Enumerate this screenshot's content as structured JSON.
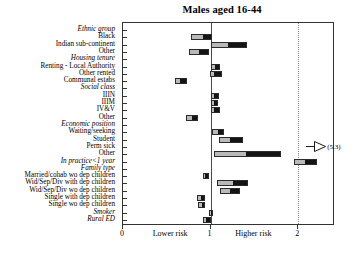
{
  "chart_data": {
    "type": "bar",
    "title": "Males aged 16-44",
    "xlabel": "",
    "ylabel": "",
    "xlim": [
      0,
      2.42
    ],
    "grid": false,
    "legend_position": "none",
    "reference_lines": [
      {
        "value": 1,
        "style": "solid"
      },
      {
        "value": 2,
        "style": "dotted"
      }
    ],
    "xticks": [
      0,
      1,
      2
    ],
    "xtick_labels": [
      "0",
      "1",
      "2"
    ],
    "zone_labels": [
      {
        "text": "Lower risk",
        "x": 0.55
      },
      {
        "text": "Higher risk",
        "x": 1.5
      }
    ],
    "annotations": [
      {
        "text": "(5.3)",
        "row": "Perm sick",
        "type": "off-scale-arrow",
        "value": 5.3
      }
    ],
    "categories": [
      {
        "label": "Ethnic group",
        "heading": true
      },
      {
        "label": "Black",
        "heading": false,
        "low": 0.78,
        "mid": 0.92,
        "high": 1.02
      },
      {
        "label": "Indian sub-continent",
        "heading": false,
        "low": 1.01,
        "mid": 1.2,
        "high": 1.42
      },
      {
        "label": "Other",
        "heading": false,
        "low": 0.75,
        "mid": 0.87,
        "high": 0.98
      },
      {
        "label": "Housing tenure",
        "heading": true
      },
      {
        "label": "Renting - Local Authority",
        "heading": false,
        "low": 1.0,
        "mid": 1.05,
        "high": 1.11
      },
      {
        "label": "Other rented",
        "heading": false,
        "low": 0.99,
        "mid": 1.04,
        "high": 1.13
      },
      {
        "label": "Communal estabs",
        "heading": false,
        "low": 0.59,
        "mid": 0.65,
        "high": 0.73
      },
      {
        "label": "Social class",
        "heading": true
      },
      {
        "label": "IIIN",
        "heading": false,
        "low": 1.0,
        "mid": 1.04,
        "high": 1.1
      },
      {
        "label": "IIIM",
        "heading": false,
        "low": 1.0,
        "mid": 1.03,
        "high": 1.09
      },
      {
        "label": "IV&V",
        "heading": false,
        "low": 1.0,
        "mid": 1.04,
        "high": 1.11
      },
      {
        "label": "Other",
        "heading": false,
        "low": 0.72,
        "mid": 0.79,
        "high": 0.86
      },
      {
        "label": "Economic position",
        "heading": true
      },
      {
        "label": "Waiting/seeking",
        "heading": false,
        "low": 1.02,
        "mid": 1.08,
        "high": 1.15
      },
      {
        "label": "Student",
        "heading": false,
        "low": 1.1,
        "mid": 1.22,
        "high": 1.37
      },
      {
        "label": "Perm sick",
        "heading": false,
        "low": null,
        "mid": 5.3,
        "high": null
      },
      {
        "label": "Other",
        "heading": false,
        "low": 1.04,
        "mid": 1.4,
        "high": 1.8
      },
      {
        "label": "In practice<1 year",
        "heading": true,
        "low": 1.95,
        "mid": 2.08,
        "high": 2.21
      },
      {
        "label": "Family type",
        "heading": true
      },
      {
        "label": "Married/cohab wo dep children",
        "heading": false,
        "low": 0.91,
        "mid": 0.94,
        "high": 0.98
      },
      {
        "label": "Wid/Sep/Div with dep children",
        "heading": false,
        "low": 1.07,
        "mid": 1.25,
        "high": 1.43
      },
      {
        "label": "Wid/Sep/Div wo dep children",
        "heading": false,
        "low": 1.11,
        "mid": 1.22,
        "high": 1.33
      },
      {
        "label": "Single with dep children",
        "heading": false,
        "low": 0.84,
        "mid": 0.89,
        "high": 0.94
      },
      {
        "label": "Single wo dep children",
        "heading": false,
        "low": 0.86,
        "mid": 0.9,
        "high": 0.94
      },
      {
        "label": "Smoker",
        "heading": true,
        "low": 0.98,
        "mid": 1.0,
        "high": 1.03
      },
      {
        "label": "Rural ED",
        "heading": true,
        "low": 0.91,
        "mid": 0.95,
        "high": 1.0
      }
    ]
  }
}
